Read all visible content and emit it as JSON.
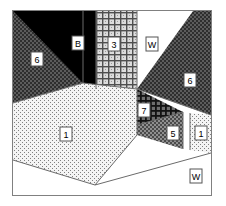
{
  "figure": {
    "kind": "segmented-room-scene",
    "width": 226,
    "height": 206,
    "frame": {
      "x": 12,
      "y": 10,
      "width": 200,
      "height": 186,
      "stroke": "#808080"
    },
    "background": "#ffffff"
  },
  "regions": [
    {
      "id": "left-wall-6",
      "label": "6",
      "pattern": "dark-gray-dither",
      "color": "#4a4a4a",
      "points": "13,11 13,103 83,83 83,11",
      "label_x": 37,
      "label_y": 59
    },
    {
      "id": "ceiling-black-B",
      "label": "B",
      "pattern": "solid-black",
      "color": "#000000",
      "points": "13,11 96,11 96,89 83,83",
      "label_x": 78,
      "label_y": 43
    },
    {
      "id": "back-wall-strip-3",
      "label": "3",
      "pattern": "cross-hatch-grid",
      "color": "#9a9a9a",
      "points": "96,11 137,11 137,89 96,89",
      "label_x": 114,
      "label_y": 44
    },
    {
      "id": "white-panel-W-top",
      "label": "W",
      "pattern": "solid-white",
      "color": "#ffffff",
      "points": "137,11 193,11 137,89",
      "label_x": 152,
      "label_y": 44
    },
    {
      "id": "right-wall-6",
      "label": "6",
      "pattern": "dark-gray-dither",
      "color": "#4a4a4a",
      "points": "193,11 211,11 211,115 137,89",
      "label_x": 190,
      "label_y": 80
    },
    {
      "id": "dark-crosshatch-7",
      "label": "7",
      "pattern": "dense-cross-hatch",
      "color": "#3a3a3a",
      "points": "137,89 183,112 183,125 137,125",
      "label_x": 144,
      "label_y": 110
    },
    {
      "id": "mid-gray-5",
      "label": "5",
      "pattern": "mid-gray-dither",
      "color": "#707070",
      "points": "137,125 183,112 183,149 137,135",
      "label_x": 173,
      "label_y": 133
    },
    {
      "id": "right-strip-1",
      "label": "1",
      "pattern": "light-stipple",
      "color": "#e8e8e8",
      "points": "190,113 211,115 211,153 190,150",
      "label_x": 201,
      "label_y": 133
    },
    {
      "id": "floor-1",
      "label": "1",
      "pattern": "light-stipple",
      "color": "#ededed",
      "points": "13,103 83,83 137,89 137,135 95,185 13,160",
      "label_x": 66,
      "label_y": 134
    },
    {
      "id": "white-panel-W-bottom",
      "label": "W",
      "pattern": "solid-white",
      "color": "#ffffff",
      "points": "13,160 95,185 211,153 211,195 13,195",
      "label_x": 196,
      "label_y": 176
    }
  ],
  "patterns": {
    "dark-gray-dither": {
      "fg": "#3d3d3d",
      "bg": "#5c5c5c"
    },
    "mid-gray-dither": {
      "fg": "#4f4f4f",
      "bg": "#8a8a8a"
    },
    "light-stipple": {
      "fg": "#777777",
      "bg": "#f2f2f2"
    },
    "cross-hatch-grid": {
      "fg": "#555555",
      "bg": "#d8d8d8"
    },
    "dense-cross-hatch": {
      "fg": "#1c1c1c",
      "bg": "#6e6e6e"
    },
    "solid-black": {
      "fg": "#000000",
      "bg": "#000000"
    },
    "solid-white": {
      "fg": "#ffffff",
      "bg": "#ffffff"
    }
  }
}
